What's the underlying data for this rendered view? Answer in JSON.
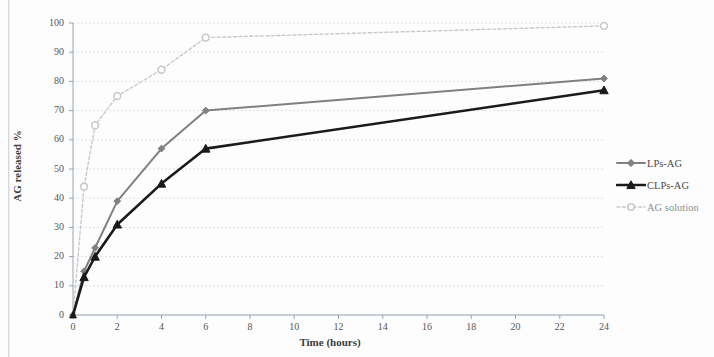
{
  "chart_data": {
    "type": "line",
    "title": "",
    "xlabel": "Time (hours)",
    "ylabel": "AG released %",
    "xlim": [
      0,
      24
    ],
    "ylim": [
      0,
      100
    ],
    "xticks": [
      0,
      2,
      4,
      6,
      8,
      10,
      12,
      14,
      16,
      18,
      20,
      22,
      24
    ],
    "yticks": [
      0,
      10,
      20,
      30,
      40,
      50,
      60,
      70,
      80,
      90,
      100
    ],
    "grid": "horizontal",
    "legend_position": "right",
    "x": [
      0,
      0.5,
      1,
      2,
      4,
      6,
      24
    ],
    "series": [
      {
        "name": "LPs-AG",
        "color": "#808080",
        "marker": "diamond",
        "dash": "solid",
        "values": [
          0,
          15,
          23,
          39,
          57,
          70,
          81
        ]
      },
      {
        "name": "CLPs-AG",
        "color": "#1a1a1a",
        "marker": "triangle",
        "dash": "solid",
        "values": [
          0,
          13,
          20,
          31,
          45,
          57,
          77
        ]
      },
      {
        "name": "AG solution",
        "color": "#c9c9c9",
        "marker": "circle",
        "dash": "dashed",
        "values": [
          0,
          44,
          65,
          75,
          84,
          95,
          99
        ]
      }
    ]
  },
  "axis": {
    "x_title": "Time (hours)",
    "y_title": "AG released %",
    "x_tick_labels": [
      "0",
      "2",
      "4",
      "6",
      "8",
      "10",
      "12",
      "14",
      "16",
      "18",
      "20",
      "22",
      "24"
    ],
    "y_tick_labels": [
      "0",
      "10",
      "20",
      "30",
      "40",
      "50",
      "60",
      "70",
      "80",
      "90",
      "100"
    ]
  },
  "legend": {
    "items": [
      {
        "label": "LPs-AG",
        "color": "#808080",
        "marker": "diamond",
        "dash": "solid"
      },
      {
        "label": "CLPs-AG",
        "color": "#1a1a1a",
        "marker": "triangle",
        "dash": "solid"
      },
      {
        "label": "AG solution",
        "color": "#c9c9c9",
        "marker": "circle",
        "dash": "dashed"
      }
    ]
  },
  "colors": {
    "lps": "#808080",
    "clps": "#1a1a1a",
    "solution": "#c9c9c9",
    "grid": "#cfd8e6",
    "axis": "#9aa4b4",
    "text": "#4a4a4a"
  }
}
